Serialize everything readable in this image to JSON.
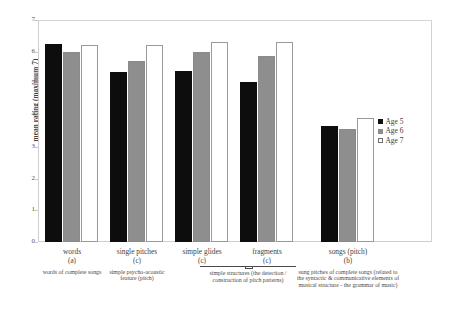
{
  "chart_data": {
    "type": "bar",
    "title": "",
    "xlabel": "",
    "ylabel": "mean rating (maximum 7)",
    "ylim": [
      0,
      7
    ],
    "yticks": [
      "0",
      "1",
      "2",
      "3",
      "4",
      "5",
      "6",
      "7"
    ],
    "grid": false,
    "legend_position": "right",
    "categories": [
      "words",
      "single pitches",
      "simple glides",
      "fragments",
      "songs (pitch)"
    ],
    "category_codes": [
      "(a)",
      "(c)",
      "(c)",
      "(c)",
      "(b)"
    ],
    "category_descriptions": [
      "words of complete songs",
      "simple psycho-acoustic feature (pitch)",
      "",
      "",
      "sung pitches of complete songs (related to the syntactic & communicative elements of musical structure - the grammar of music)"
    ],
    "shared_description": {
      "spans": [
        "simple glides",
        "fragments"
      ],
      "text": "simple structures (the detection / construction of pitch patterns)"
    },
    "series": [
      {
        "name": "Age 5",
        "color": "#101010",
        "values": [
          6.25,
          5.35,
          5.4,
          5.05,
          3.65
        ]
      },
      {
        "name": "Age 6",
        "color": "#8e8e8e",
        "values": [
          6.0,
          5.7,
          6.0,
          5.85,
          3.55
        ]
      },
      {
        "name": "Age 7",
        "color": "#ffffff",
        "values": [
          6.2,
          6.2,
          6.3,
          6.3,
          3.9
        ]
      }
    ]
  },
  "legend": {
    "items": [
      {
        "label": "Age 5"
      },
      {
        "label": "Age 6"
      },
      {
        "label": "Age 7"
      }
    ]
  }
}
